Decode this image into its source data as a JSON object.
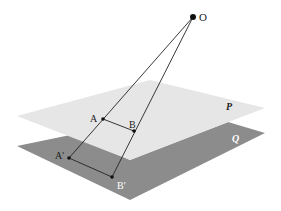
{
  "diagram": {
    "colors": {
      "plane_p": "#e6e6e6",
      "plane_q": "#8c8c8c",
      "line": "#222222",
      "point": "#111111",
      "label_dark": "#222222",
      "label_light": "#ffffff"
    },
    "planes": [
      {
        "id": "P",
        "label": "P",
        "points": "17,116 150,80 265,108 130,160"
      },
      {
        "id": "Q",
        "label": "Q",
        "points": "17,146 80,133 130,160 228,122 265,133 130,200"
      }
    ],
    "points": [
      {
        "id": "O",
        "label": "O",
        "x": 193,
        "y": 17,
        "r": 3
      },
      {
        "id": "A",
        "label": "A",
        "x": 103,
        "y": 119,
        "r": 1.8
      },
      {
        "id": "B",
        "label": "B",
        "x": 134,
        "y": 131,
        "r": 1.8
      },
      {
        "id": "A1",
        "label": "A'",
        "x": 69,
        "y": 158,
        "r": 1.8
      },
      {
        "id": "B1",
        "label": "B'",
        "x": 112,
        "y": 177,
        "r": 1.8
      }
    ],
    "segments": [
      [
        "O",
        "A1"
      ],
      [
        "O",
        "B1"
      ],
      [
        "A",
        "B"
      ],
      [
        "A1",
        "B1"
      ]
    ]
  }
}
